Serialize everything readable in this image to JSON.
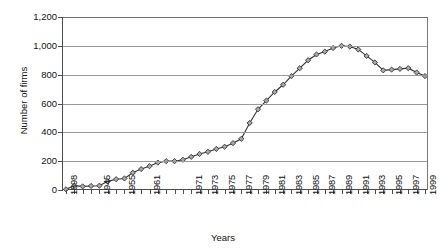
{
  "chart_data": {
    "type": "line",
    "title": "",
    "xlabel": "Years",
    "ylabel": "Number of firms",
    "ylim": [
      0,
      1200
    ],
    "yticks": [
      0,
      200,
      400,
      600,
      800,
      1000,
      1200
    ],
    "ytick_labels": [
      "0",
      "200",
      "400",
      "600",
      "800",
      "1,000",
      "1,200"
    ],
    "grid": true,
    "legend": "none",
    "marker": "diamond",
    "x": [
      1898,
      1925,
      1935,
      1940,
      1945,
      1950,
      1953,
      1955,
      1957,
      1959,
      1961,
      1963,
      1965,
      1967,
      1969,
      1971,
      1972,
      1973,
      1974,
      1975,
      1976,
      1977,
      1978,
      1979,
      1980,
      1981,
      1982,
      1983,
      1984,
      1985,
      1986,
      1987,
      1988,
      1989,
      1990,
      1991,
      1992,
      1993,
      1994,
      1995,
      1996,
      1997,
      1998,
      1999
    ],
    "values": [
      5,
      30,
      25,
      28,
      30,
      60,
      75,
      80,
      120,
      145,
      165,
      190,
      200,
      200,
      210,
      230,
      250,
      265,
      285,
      300,
      325,
      355,
      465,
      560,
      620,
      680,
      730,
      790,
      845,
      900,
      940,
      960,
      985,
      1000,
      995,
      975,
      930,
      885,
      830,
      835,
      840,
      845,
      815,
      790
    ],
    "xtick_labels": [
      "1898",
      "1945",
      "1955",
      "1961",
      "1971",
      "1973",
      "1975",
      "1977",
      "1979",
      "1981",
      "1983",
      "1985",
      "1987",
      "1989",
      "1991",
      "1993",
      "1995",
      "1997",
      "1999"
    ],
    "xtick_positions": [
      1898,
      1945,
      1955,
      1961,
      1971,
      1973,
      1975,
      1977,
      1979,
      1981,
      1983,
      1985,
      1987,
      1989,
      1991,
      1993,
      1995,
      1997,
      1999
    ],
    "colors": {
      "line": "#333333",
      "marker_fill": "#a9a9a9",
      "grid": "#9a9a9a",
      "axis": "#4d4d4d",
      "background": "#ffffff"
    }
  }
}
